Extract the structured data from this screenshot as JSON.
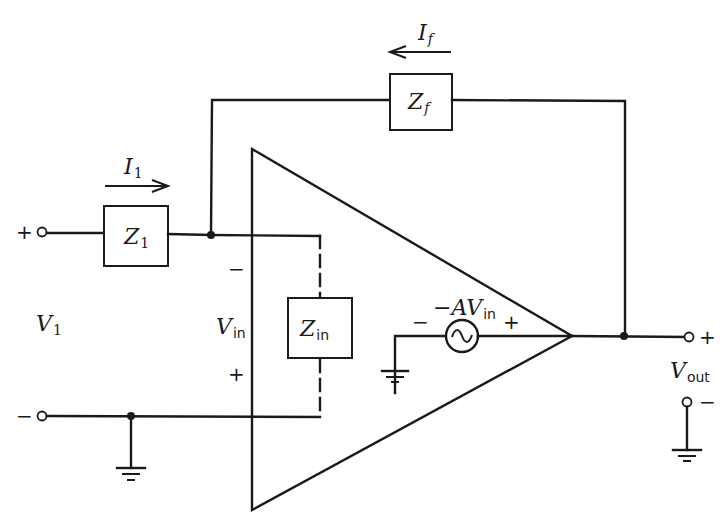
{
  "diagram": {
    "type": "inverting-opamp-equivalent-circuit",
    "components": {
      "z1": {
        "symbol": "Z",
        "sub": "1"
      },
      "zf": {
        "symbol": "Z",
        "sub": "f"
      },
      "zin": {
        "symbol": "Z",
        "sub": "in"
      },
      "source": {
        "prefix": "−",
        "symbol": "AV",
        "sub": "in"
      }
    },
    "currents": {
      "i1": {
        "symbol": "I",
        "sub": "1",
        "direction": "right"
      },
      "if": {
        "symbol": "I",
        "sub": "f",
        "direction": "left"
      }
    },
    "voltages": {
      "v1": {
        "symbol": "V",
        "sub": "1"
      },
      "vin": {
        "symbol": "V",
        "sub": "in"
      },
      "vout": {
        "symbol": "V",
        "sub": "out"
      }
    },
    "signs": {
      "input_plus": "+",
      "input_minus": "−",
      "vin_minus": "−",
      "vin_plus": "+",
      "source_minus": "−",
      "source_plus": "+",
      "output_plus": "+",
      "output_minus": "−"
    }
  }
}
